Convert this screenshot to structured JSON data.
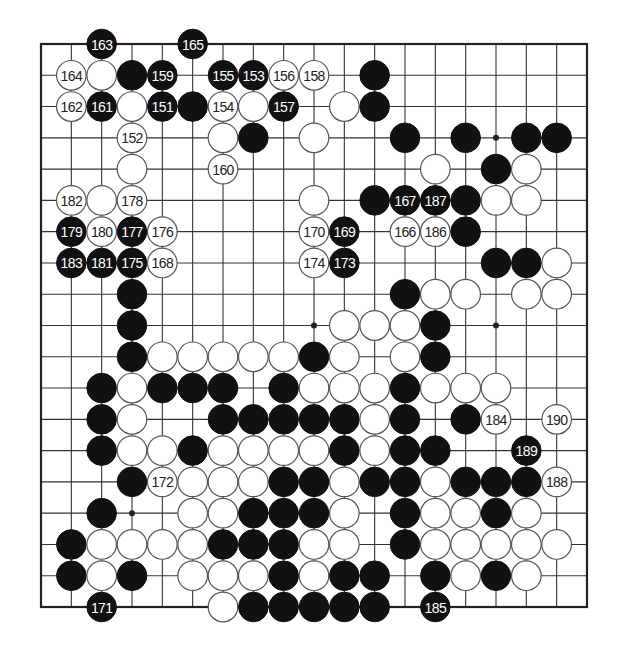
{
  "board": {
    "size": 19,
    "colors": {
      "black": "#111111",
      "white": "#ffffff",
      "line": "#333333"
    },
    "star_points_visible": [
      [
        15,
        3
      ],
      [
        9,
        9
      ],
      [
        15,
        9
      ],
      [
        3,
        15
      ]
    ],
    "stones": [
      {
        "c": 2,
        "r": 0,
        "color": "B",
        "label": "163"
      },
      {
        "c": 5,
        "r": 0,
        "color": "B",
        "label": "165"
      },
      {
        "c": 1,
        "r": 1,
        "color": "W",
        "label": "164"
      },
      {
        "c": 2,
        "r": 1,
        "color": "W",
        "label": ""
      },
      {
        "c": 3,
        "r": 1,
        "color": "B",
        "label": ""
      },
      {
        "c": 4,
        "r": 1,
        "color": "B",
        "label": "159"
      },
      {
        "c": 6,
        "r": 1,
        "color": "B",
        "label": "155"
      },
      {
        "c": 7,
        "r": 1,
        "color": "B",
        "label": "153"
      },
      {
        "c": 8,
        "r": 1,
        "color": "W",
        "label": "156"
      },
      {
        "c": 9,
        "r": 1,
        "color": "W",
        "label": "158"
      },
      {
        "c": 11,
        "r": 1,
        "color": "B",
        "label": ""
      },
      {
        "c": 1,
        "r": 2,
        "color": "W",
        "label": "162"
      },
      {
        "c": 2,
        "r": 2,
        "color": "B",
        "label": "161"
      },
      {
        "c": 3,
        "r": 2,
        "color": "W",
        "label": ""
      },
      {
        "c": 4,
        "r": 2,
        "color": "B",
        "label": "151"
      },
      {
        "c": 5,
        "r": 2,
        "color": "B",
        "label": ""
      },
      {
        "c": 6,
        "r": 2,
        "color": "W",
        "label": "154"
      },
      {
        "c": 7,
        "r": 2,
        "color": "W",
        "label": ""
      },
      {
        "c": 8,
        "r": 2,
        "color": "B",
        "label": "157"
      },
      {
        "c": 10,
        "r": 2,
        "color": "W",
        "label": ""
      },
      {
        "c": 11,
        "r": 2,
        "color": "B",
        "label": ""
      },
      {
        "c": 3,
        "r": 3,
        "color": "W",
        "label": "152"
      },
      {
        "c": 6,
        "r": 3,
        "color": "W",
        "label": ""
      },
      {
        "c": 7,
        "r": 3,
        "color": "B",
        "label": ""
      },
      {
        "c": 9,
        "r": 3,
        "color": "W",
        "label": ""
      },
      {
        "c": 12,
        "r": 3,
        "color": "B",
        "label": ""
      },
      {
        "c": 14,
        "r": 3,
        "color": "B",
        "label": ""
      },
      {
        "c": 16,
        "r": 3,
        "color": "B",
        "label": ""
      },
      {
        "c": 17,
        "r": 3,
        "color": "B",
        "label": ""
      },
      {
        "c": 3,
        "r": 4,
        "color": "W",
        "label": ""
      },
      {
        "c": 6,
        "r": 4,
        "color": "W",
        "label": "160"
      },
      {
        "c": 13,
        "r": 4,
        "color": "W",
        "label": ""
      },
      {
        "c": 15,
        "r": 4,
        "color": "B",
        "label": ""
      },
      {
        "c": 16,
        "r": 4,
        "color": "W",
        "label": ""
      },
      {
        "c": 1,
        "r": 5,
        "color": "W",
        "label": "182"
      },
      {
        "c": 2,
        "r": 5,
        "color": "W",
        "label": ""
      },
      {
        "c": 3,
        "r": 5,
        "color": "W",
        "label": "178"
      },
      {
        "c": 9,
        "r": 5,
        "color": "W",
        "label": ""
      },
      {
        "c": 11,
        "r": 5,
        "color": "B",
        "label": ""
      },
      {
        "c": 12,
        "r": 5,
        "color": "B",
        "label": "167"
      },
      {
        "c": 13,
        "r": 5,
        "color": "B",
        "label": "187"
      },
      {
        "c": 14,
        "r": 5,
        "color": "B",
        "label": ""
      },
      {
        "c": 15,
        "r": 5,
        "color": "W",
        "label": ""
      },
      {
        "c": 16,
        "r": 5,
        "color": "W",
        "label": ""
      },
      {
        "c": 1,
        "r": 6,
        "color": "B",
        "label": "179"
      },
      {
        "c": 2,
        "r": 6,
        "color": "W",
        "label": "180"
      },
      {
        "c": 3,
        "r": 6,
        "color": "B",
        "label": "177"
      },
      {
        "c": 4,
        "r": 6,
        "color": "W",
        "label": "176"
      },
      {
        "c": 9,
        "r": 6,
        "color": "W",
        "label": "170"
      },
      {
        "c": 10,
        "r": 6,
        "color": "B",
        "label": "169"
      },
      {
        "c": 12,
        "r": 6,
        "color": "W",
        "label": "166"
      },
      {
        "c": 13,
        "r": 6,
        "color": "W",
        "label": "186"
      },
      {
        "c": 14,
        "r": 6,
        "color": "B",
        "label": ""
      },
      {
        "c": 1,
        "r": 7,
        "color": "B",
        "label": "183"
      },
      {
        "c": 2,
        "r": 7,
        "color": "B",
        "label": "181"
      },
      {
        "c": 3,
        "r": 7,
        "color": "B",
        "label": "175"
      },
      {
        "c": 4,
        "r": 7,
        "color": "W",
        "label": "168"
      },
      {
        "c": 9,
        "r": 7,
        "color": "W",
        "label": "174"
      },
      {
        "c": 10,
        "r": 7,
        "color": "B",
        "label": "173"
      },
      {
        "c": 15,
        "r": 7,
        "color": "B",
        "label": ""
      },
      {
        "c": 16,
        "r": 7,
        "color": "B",
        "label": ""
      },
      {
        "c": 17,
        "r": 7,
        "color": "W",
        "label": ""
      },
      {
        "c": 3,
        "r": 8,
        "color": "B",
        "label": ""
      },
      {
        "c": 12,
        "r": 8,
        "color": "B",
        "label": ""
      },
      {
        "c": 13,
        "r": 8,
        "color": "W",
        "label": ""
      },
      {
        "c": 14,
        "r": 8,
        "color": "W",
        "label": ""
      },
      {
        "c": 16,
        "r": 8,
        "color": "W",
        "label": ""
      },
      {
        "c": 17,
        "r": 8,
        "color": "W",
        "label": ""
      },
      {
        "c": 3,
        "r": 9,
        "color": "B",
        "label": ""
      },
      {
        "c": 10,
        "r": 9,
        "color": "W",
        "label": ""
      },
      {
        "c": 11,
        "r": 9,
        "color": "W",
        "label": ""
      },
      {
        "c": 12,
        "r": 9,
        "color": "W",
        "label": ""
      },
      {
        "c": 13,
        "r": 9,
        "color": "B",
        "label": ""
      },
      {
        "c": 3,
        "r": 10,
        "color": "B",
        "label": ""
      },
      {
        "c": 4,
        "r": 10,
        "color": "W",
        "label": ""
      },
      {
        "c": 5,
        "r": 10,
        "color": "W",
        "label": ""
      },
      {
        "c": 6,
        "r": 10,
        "color": "W",
        "label": ""
      },
      {
        "c": 7,
        "r": 10,
        "color": "W",
        "label": ""
      },
      {
        "c": 8,
        "r": 10,
        "color": "W",
        "label": ""
      },
      {
        "c": 9,
        "r": 10,
        "color": "B",
        "label": ""
      },
      {
        "c": 10,
        "r": 10,
        "color": "W",
        "label": ""
      },
      {
        "c": 12,
        "r": 10,
        "color": "W",
        "label": ""
      },
      {
        "c": 13,
        "r": 10,
        "color": "B",
        "label": ""
      },
      {
        "c": 2,
        "r": 11,
        "color": "B",
        "label": ""
      },
      {
        "c": 3,
        "r": 11,
        "color": "W",
        "label": ""
      },
      {
        "c": 4,
        "r": 11,
        "color": "B",
        "label": ""
      },
      {
        "c": 5,
        "r": 11,
        "color": "B",
        "label": ""
      },
      {
        "c": 6,
        "r": 11,
        "color": "B",
        "label": ""
      },
      {
        "c": 8,
        "r": 11,
        "color": "B",
        "label": ""
      },
      {
        "c": 9,
        "r": 11,
        "color": "W",
        "label": ""
      },
      {
        "c": 10,
        "r": 11,
        "color": "W",
        "label": ""
      },
      {
        "c": 11,
        "r": 11,
        "color": "W",
        "label": ""
      },
      {
        "c": 12,
        "r": 11,
        "color": "B",
        "label": ""
      },
      {
        "c": 13,
        "r": 11,
        "color": "W",
        "label": ""
      },
      {
        "c": 14,
        "r": 11,
        "color": "W",
        "label": ""
      },
      {
        "c": 15,
        "r": 11,
        "color": "W",
        "label": ""
      },
      {
        "c": 2,
        "r": 12,
        "color": "B",
        "label": ""
      },
      {
        "c": 3,
        "r": 12,
        "color": "W",
        "label": ""
      },
      {
        "c": 6,
        "r": 12,
        "color": "B",
        "label": ""
      },
      {
        "c": 7,
        "r": 12,
        "color": "B",
        "label": ""
      },
      {
        "c": 8,
        "r": 12,
        "color": "B",
        "label": ""
      },
      {
        "c": 9,
        "r": 12,
        "color": "B",
        "label": ""
      },
      {
        "c": 10,
        "r": 12,
        "color": "B",
        "label": ""
      },
      {
        "c": 11,
        "r": 12,
        "color": "W",
        "label": ""
      },
      {
        "c": 12,
        "r": 12,
        "color": "B",
        "label": ""
      },
      {
        "c": 14,
        "r": 12,
        "color": "B",
        "label": ""
      },
      {
        "c": 15,
        "r": 12,
        "color": "W",
        "label": "184"
      },
      {
        "c": 17,
        "r": 12,
        "color": "W",
        "label": "190"
      },
      {
        "c": 2,
        "r": 13,
        "color": "B",
        "label": ""
      },
      {
        "c": 3,
        "r": 13,
        "color": "W",
        "label": ""
      },
      {
        "c": 4,
        "r": 13,
        "color": "W",
        "label": ""
      },
      {
        "c": 5,
        "r": 13,
        "color": "B",
        "label": ""
      },
      {
        "c": 6,
        "r": 13,
        "color": "W",
        "label": ""
      },
      {
        "c": 7,
        "r": 13,
        "color": "W",
        "label": ""
      },
      {
        "c": 8,
        "r": 13,
        "color": "W",
        "label": ""
      },
      {
        "c": 9,
        "r": 13,
        "color": "W",
        "label": ""
      },
      {
        "c": 10,
        "r": 13,
        "color": "B",
        "label": ""
      },
      {
        "c": 11,
        "r": 13,
        "color": "W",
        "label": ""
      },
      {
        "c": 12,
        "r": 13,
        "color": "B",
        "label": ""
      },
      {
        "c": 13,
        "r": 13,
        "color": "B",
        "label": ""
      },
      {
        "c": 16,
        "r": 13,
        "color": "B",
        "label": "189"
      },
      {
        "c": 3,
        "r": 14,
        "color": "B",
        "label": ""
      },
      {
        "c": 4,
        "r": 14,
        "color": "W",
        "label": "172"
      },
      {
        "c": 5,
        "r": 14,
        "color": "W",
        "label": ""
      },
      {
        "c": 6,
        "r": 14,
        "color": "W",
        "label": ""
      },
      {
        "c": 7,
        "r": 14,
        "color": "W",
        "label": ""
      },
      {
        "c": 8,
        "r": 14,
        "color": "B",
        "label": ""
      },
      {
        "c": 9,
        "r": 14,
        "color": "B",
        "label": ""
      },
      {
        "c": 10,
        "r": 14,
        "color": "W",
        "label": ""
      },
      {
        "c": 11,
        "r": 14,
        "color": "B",
        "label": ""
      },
      {
        "c": 12,
        "r": 14,
        "color": "B",
        "label": ""
      },
      {
        "c": 13,
        "r": 14,
        "color": "W",
        "label": ""
      },
      {
        "c": 14,
        "r": 14,
        "color": "B",
        "label": ""
      },
      {
        "c": 15,
        "r": 14,
        "color": "B",
        "label": ""
      },
      {
        "c": 16,
        "r": 14,
        "color": "B",
        "label": ""
      },
      {
        "c": 17,
        "r": 14,
        "color": "W",
        "label": "188"
      },
      {
        "c": 2,
        "r": 15,
        "color": "B",
        "label": ""
      },
      {
        "c": 5,
        "r": 15,
        "color": "W",
        "label": ""
      },
      {
        "c": 6,
        "r": 15,
        "color": "W",
        "label": ""
      },
      {
        "c": 7,
        "r": 15,
        "color": "B",
        "label": ""
      },
      {
        "c": 8,
        "r": 15,
        "color": "B",
        "label": ""
      },
      {
        "c": 9,
        "r": 15,
        "color": "B",
        "label": ""
      },
      {
        "c": 10,
        "r": 15,
        "color": "W",
        "label": ""
      },
      {
        "c": 12,
        "r": 15,
        "color": "B",
        "label": ""
      },
      {
        "c": 13,
        "r": 15,
        "color": "W",
        "label": ""
      },
      {
        "c": 14,
        "r": 15,
        "color": "W",
        "label": ""
      },
      {
        "c": 15,
        "r": 15,
        "color": "B",
        "label": ""
      },
      {
        "c": 16,
        "r": 15,
        "color": "W",
        "label": ""
      },
      {
        "c": 1,
        "r": 16,
        "color": "B",
        "label": ""
      },
      {
        "c": 2,
        "r": 16,
        "color": "W",
        "label": ""
      },
      {
        "c": 3,
        "r": 16,
        "color": "W",
        "label": ""
      },
      {
        "c": 4,
        "r": 16,
        "color": "W",
        "label": ""
      },
      {
        "c": 5,
        "r": 16,
        "color": "W",
        "label": ""
      },
      {
        "c": 6,
        "r": 16,
        "color": "B",
        "label": ""
      },
      {
        "c": 7,
        "r": 16,
        "color": "B",
        "label": ""
      },
      {
        "c": 8,
        "r": 16,
        "color": "B",
        "label": ""
      },
      {
        "c": 9,
        "r": 16,
        "color": "W",
        "label": ""
      },
      {
        "c": 10,
        "r": 16,
        "color": "W",
        "label": ""
      },
      {
        "c": 12,
        "r": 16,
        "color": "B",
        "label": ""
      },
      {
        "c": 13,
        "r": 16,
        "color": "W",
        "label": ""
      },
      {
        "c": 14,
        "r": 16,
        "color": "W",
        "label": ""
      },
      {
        "c": 15,
        "r": 16,
        "color": "W",
        "label": ""
      },
      {
        "c": 16,
        "r": 16,
        "color": "W",
        "label": ""
      },
      {
        "c": 17,
        "r": 16,
        "color": "W",
        "label": ""
      },
      {
        "c": 1,
        "r": 17,
        "color": "B",
        "label": ""
      },
      {
        "c": 2,
        "r": 17,
        "color": "W",
        "label": ""
      },
      {
        "c": 3,
        "r": 17,
        "color": "B",
        "label": ""
      },
      {
        "c": 5,
        "r": 17,
        "color": "W",
        "label": ""
      },
      {
        "c": 6,
        "r": 17,
        "color": "W",
        "label": ""
      },
      {
        "c": 7,
        "r": 17,
        "color": "W",
        "label": ""
      },
      {
        "c": 8,
        "r": 17,
        "color": "B",
        "label": ""
      },
      {
        "c": 9,
        "r": 17,
        "color": "W",
        "label": ""
      },
      {
        "c": 10,
        "r": 17,
        "color": "B",
        "label": ""
      },
      {
        "c": 11,
        "r": 17,
        "color": "B",
        "label": ""
      },
      {
        "c": 13,
        "r": 17,
        "color": "B",
        "label": ""
      },
      {
        "c": 14,
        "r": 17,
        "color": "W",
        "label": ""
      },
      {
        "c": 15,
        "r": 17,
        "color": "B",
        "label": ""
      },
      {
        "c": 16,
        "r": 17,
        "color": "W",
        "label": ""
      },
      {
        "c": 2,
        "r": 18,
        "color": "B",
        "label": "171"
      },
      {
        "c": 6,
        "r": 18,
        "color": "W",
        "label": ""
      },
      {
        "c": 7,
        "r": 18,
        "color": "B",
        "label": ""
      },
      {
        "c": 8,
        "r": 18,
        "color": "B",
        "label": ""
      },
      {
        "c": 9,
        "r": 18,
        "color": "B",
        "label": ""
      },
      {
        "c": 10,
        "r": 18,
        "color": "B",
        "label": ""
      },
      {
        "c": 11,
        "r": 18,
        "color": "B",
        "label": ""
      },
      {
        "c": 13,
        "r": 18,
        "color": "B",
        "label": "185"
      }
    ]
  }
}
